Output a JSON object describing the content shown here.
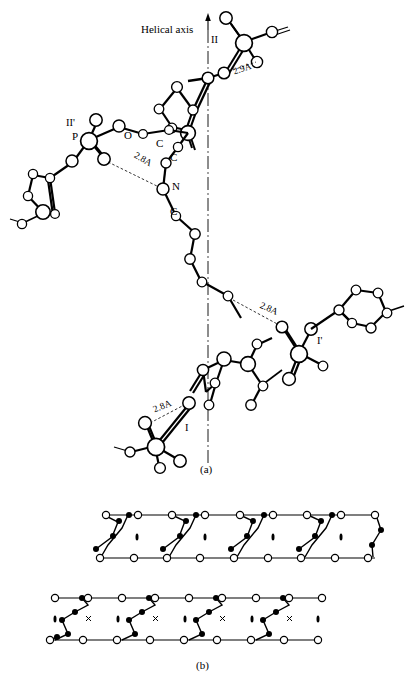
{
  "figure": {
    "panels": [
      {
        "id": "a",
        "caption": "(a)"
      },
      {
        "id": "b",
        "caption": "(b)"
      }
    ],
    "axis_label": "Helical axis",
    "atom_labels": [
      {
        "text": "P",
        "x": 74,
        "y": 137
      },
      {
        "text": "O",
        "x": 126,
        "y": 132
      },
      {
        "text": "C",
        "x": 157,
        "y": 141
      },
      {
        "text": "C",
        "x": 171,
        "y": 157
      },
      {
        "text": "N",
        "x": 174,
        "y": 186
      },
      {
        "text": "C",
        "x": 172,
        "y": 212
      }
    ],
    "group_labels": [
      {
        "text": "II",
        "x": 211,
        "y": 41
      },
      {
        "text": "II'",
        "x": 68,
        "y": 123
      },
      {
        "text": "I'",
        "x": 318,
        "y": 341
      },
      {
        "text": "I",
        "x": 186,
        "y": 429
      }
    ],
    "distance_labels": [
      {
        "text": "2.9A",
        "x": 234,
        "y": 72
      },
      {
        "text": "2.8A",
        "x": 138,
        "y": 155
      },
      {
        "text": "2.8A",
        "x": 264,
        "y": 305
      },
      {
        "text": "2.8A",
        "x": 155,
        "y": 409
      }
    ],
    "colors": {
      "stroke": "#000000",
      "atom_fill": "#ffffff",
      "filled_atom": "#000000",
      "background": "#ffffff"
    }
  }
}
